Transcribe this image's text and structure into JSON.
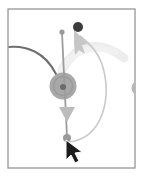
{
  "figure": {
    "canvas": {
      "width": 143,
      "height": 177,
      "background": "#ffffff"
    },
    "frame": {
      "name": "canvas-border",
      "x": 8,
      "y": 9,
      "width": 127,
      "height": 159,
      "stroke": "#8d8d8d",
      "stroke_width": 1.2,
      "fill": "#ffffff"
    },
    "colors": {
      "frame_border": "#8d8d8d",
      "incoming_edge": "#6e6e6e",
      "node_disk": "#a8a8a8",
      "node_ring": "#9a9a9a",
      "node_center_dot": "#6b6b6b",
      "drag_line": "#9c9c9c",
      "endpoint_dot": "#989898",
      "target_dot": "#3c3c3c",
      "ghost_arrow": "#c9c9c9",
      "ghost_trail": "#ededed",
      "cursor_fill": "#1c1c1c",
      "cursor_outline": "#ffffff",
      "edge_circle_right": "#b5b5b5"
    },
    "elements": [
      {
        "name": "incoming-edge-curve",
        "kind": "path",
        "description": "dark gray curve entering from left border arcing down into the node",
        "d": "M 8,47 C 26,45 45,52 56,74",
        "stroke": "#6e6e6e",
        "stroke_width": 2.0
      },
      {
        "name": "ghost-trail-arc",
        "kind": "path",
        "description": "faint light-gray motion trail arc in upper right region",
        "d": "M 62,70 C 78,40 104,42 124,58",
        "stroke": "#ededed",
        "stroke_width": 9
      },
      {
        "name": "ghost-trail-arc-inner",
        "kind": "path",
        "description": "second faint trail sweeping from node up and right",
        "d": "M 60,74 C 70,50 92,44 116,52",
        "stroke": "#f1f1f1",
        "stroke_width": 6
      },
      {
        "name": "node-disk",
        "kind": "circle",
        "description": "central gray node disk",
        "cx": 63,
        "cy": 86,
        "r": 13.5,
        "fill": "#a8a8a8"
      },
      {
        "name": "node-ring",
        "kind": "circle",
        "description": "slightly darker ring on node disk",
        "cx": 63,
        "cy": 86,
        "r": 9.5,
        "stroke": "#9a9a9a",
        "stroke_width": 1.4,
        "fill": "none"
      },
      {
        "name": "node-center-dot",
        "kind": "circle",
        "description": "dark dot marking node center",
        "cx": 63,
        "cy": 87,
        "r": 3.0,
        "fill": "#6b6b6b"
      },
      {
        "name": "drag-line",
        "kind": "line",
        "description": "vertical medium-gray drag line from top handle through node to bottom endpoint",
        "x1": 62,
        "y1": 33,
        "x2": 67,
        "y2": 137,
        "stroke": "#9c9c9c",
        "stroke_width": 1.8
      },
      {
        "name": "drag-line-top-dot",
        "kind": "circle",
        "description": "small gray handle dot at top of drag line",
        "cx": 62,
        "cy": 32,
        "r": 2.6,
        "fill": "#989898"
      },
      {
        "name": "drag-line-bottom-dot",
        "kind": "circle",
        "description": "gray endpoint dot at bottom of drag line where cursor rests",
        "cx": 67,
        "cy": 138,
        "r": 4.0,
        "fill": "#9a9a9a"
      },
      {
        "name": "down-arrow-marker",
        "kind": "polygon",
        "description": "light gray downward arrowhead along the drag line",
        "points": "59,107 75,107 67,122",
        "fill": "#bcbcbc"
      },
      {
        "name": "return-curve-arrow",
        "kind": "path",
        "description": "light gray curved arrow sweeping from bottom endpoint right and up to the target dot",
        "d": "M 69,142 C 104,138 112,96 102,64 C 97,50 88,42 80,36",
        "stroke": "#c9c9c9",
        "stroke_width": 1.6
      },
      {
        "name": "return-arrowhead",
        "kind": "polygon",
        "description": "light gray arrowhead pointing up-left at the target dot",
        "points": "74,30 88,44 82,45 85,54 79,50 75,55 74,44",
        "fill": "#c6c6c6"
      },
      {
        "name": "target-dot",
        "kind": "circle",
        "description": "dark target dot at top right, drop destination",
        "cx": 78,
        "cy": 27,
        "r": 5.0,
        "fill": "#3c3c3c"
      },
      {
        "name": "right-edge-node",
        "kind": "circle",
        "description": "partial gray node clipped at right border",
        "cx": 139,
        "cy": 88,
        "r": 7.5,
        "fill": "#b5b5b5"
      },
      {
        "name": "mouse-cursor",
        "kind": "polygon",
        "description": "black mouse pointer arrow at bottom endpoint",
        "points": "66,140 66,160 71,155 75,163 79,161 75,153 82,152",
        "fill": "#1c1c1c",
        "stroke": "#ffffff",
        "stroke_width": 1.0
      }
    ]
  }
}
